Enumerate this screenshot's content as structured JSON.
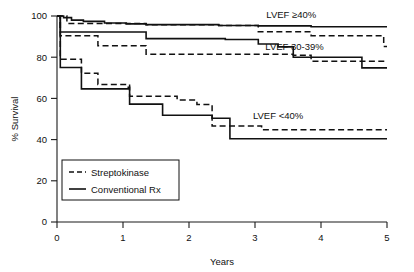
{
  "chart_data": {
    "type": "line",
    "title": "",
    "xlabel": "Years",
    "ylabel": "% Survival",
    "xlim": [
      0,
      5
    ],
    "ylim": [
      0,
      100
    ],
    "xticks": [
      "0",
      "1",
      "2",
      "3",
      "4",
      "5"
    ],
    "yticks": [
      "0",
      "20",
      "40",
      "60",
      "80",
      "100"
    ],
    "grid": false,
    "legend_position": "lower-left",
    "legend": [
      {
        "name": "Streptokinase",
        "style": "dashed"
      },
      {
        "name": "Conventional Rx",
        "style": "solid"
      }
    ],
    "group_labels": [
      {
        "id": "high",
        "text": "LVEF ≥40%"
      },
      {
        "id": "mid",
        "text": "LVEF 30-39%"
      },
      {
        "id": "low",
        "text": "LVEF <40%"
      }
    ],
    "series": [
      {
        "name": "LVEF ≥40% - Conventional Rx",
        "group": "LVEF ≥40%",
        "treatment": "Conventional Rx",
        "style": "solid",
        "points": [
          [
            0.0,
            100.0
          ],
          [
            0.1,
            100.0
          ],
          [
            0.1,
            99.2
          ],
          [
            0.22,
            99.2
          ],
          [
            0.22,
            98.0
          ],
          [
            0.4,
            98.0
          ],
          [
            0.4,
            97.4
          ],
          [
            0.72,
            97.4
          ],
          [
            0.72,
            96.6
          ],
          [
            1.05,
            96.6
          ],
          [
            1.05,
            96.2
          ],
          [
            1.35,
            96.2
          ],
          [
            1.35,
            95.8
          ],
          [
            2.45,
            95.8
          ],
          [
            2.45,
            95.4
          ],
          [
            3.05,
            95.4
          ],
          [
            3.05,
            95.2
          ],
          [
            3.85,
            95.2
          ],
          [
            3.85,
            94.8
          ],
          [
            5.0,
            94.8
          ]
        ]
      },
      {
        "name": "LVEF ≥40% - Streptokinase",
        "group": "LVEF ≥40%",
        "treatment": "Streptokinase",
        "style": "dashed",
        "points": [
          [
            0.0,
            100.0
          ],
          [
            0.15,
            100.0
          ],
          [
            0.15,
            96.4
          ],
          [
            1.35,
            96.4
          ],
          [
            1.35,
            95.8
          ],
          [
            2.45,
            95.8
          ],
          [
            2.45,
            95.4
          ],
          [
            3.05,
            95.4
          ],
          [
            3.05,
            92.4
          ],
          [
            3.85,
            92.4
          ],
          [
            3.85,
            90.4
          ],
          [
            4.95,
            90.4
          ],
          [
            4.95,
            85.2
          ],
          [
            5.0,
            85.2
          ]
        ]
      },
      {
        "name": "LVEF 30-39% - Conventional Rx",
        "group": "LVEF 30-39%",
        "treatment": "Conventional Rx",
        "style": "solid",
        "points": [
          [
            0.0,
            100.0
          ],
          [
            0.05,
            100.0
          ],
          [
            0.05,
            92.2
          ],
          [
            1.35,
            92.2
          ],
          [
            1.35,
            89.0
          ],
          [
            2.55,
            89.0
          ],
          [
            2.55,
            88.6
          ],
          [
            3.05,
            88.6
          ],
          [
            3.05,
            86.4
          ],
          [
            3.35,
            86.4
          ],
          [
            3.35,
            85.0
          ],
          [
            3.58,
            85.0
          ],
          [
            3.58,
            80.0
          ],
          [
            4.62,
            80.0
          ],
          [
            4.62,
            74.8
          ],
          [
            5.0,
            74.8
          ]
        ]
      },
      {
        "name": "LVEF 30-39% - Streptokinase",
        "group": "LVEF 30-39%",
        "treatment": "Streptokinase",
        "style": "dashed",
        "points": [
          [
            0.0,
            100.0
          ],
          [
            0.05,
            100.0
          ],
          [
            0.05,
            90.4
          ],
          [
            0.62,
            90.4
          ],
          [
            0.62,
            85.6
          ],
          [
            1.35,
            85.6
          ],
          [
            1.35,
            81.4
          ],
          [
            3.58,
            81.4
          ],
          [
            3.58,
            81.0
          ],
          [
            3.85,
            81.0
          ],
          [
            3.85,
            78.0
          ],
          [
            5.0,
            78.0
          ]
        ]
      },
      {
        "name": "LVEF <40% - Conventional Rx",
        "group": "LVEF <40%",
        "treatment": "Conventional Rx",
        "style": "solid",
        "points": [
          [
            0.0,
            100.0
          ],
          [
            0.05,
            100.0
          ],
          [
            0.05,
            75.0
          ],
          [
            0.37,
            75.0
          ],
          [
            0.37,
            64.6
          ],
          [
            1.08,
            64.6
          ],
          [
            1.08,
            65.4
          ],
          [
            1.1,
            65.4
          ],
          [
            1.1,
            57.2
          ],
          [
            1.6,
            57.2
          ],
          [
            1.6,
            51.8
          ],
          [
            2.35,
            51.8
          ],
          [
            2.35,
            50.4
          ],
          [
            2.62,
            50.4
          ],
          [
            2.62,
            40.4
          ],
          [
            5.0,
            40.4
          ]
        ]
      },
      {
        "name": "LVEF <40% - Streptokinase",
        "group": "LVEF <40%",
        "treatment": "Streptokinase",
        "style": "dashed",
        "points": [
          [
            0.0,
            100.0
          ],
          [
            0.05,
            100.0
          ],
          [
            0.05,
            79.0
          ],
          [
            0.37,
            79.0
          ],
          [
            0.37,
            72.2
          ],
          [
            0.62,
            72.2
          ],
          [
            0.62,
            66.8
          ],
          [
            1.1,
            66.8
          ],
          [
            1.1,
            61.0
          ],
          [
            1.82,
            61.0
          ],
          [
            1.82,
            59.2
          ],
          [
            2.12,
            59.2
          ],
          [
            2.12,
            57.0
          ],
          [
            2.35,
            57.0
          ],
          [
            2.35,
            46.6
          ],
          [
            3.1,
            46.6
          ],
          [
            3.1,
            44.8
          ],
          [
            5.0,
            44.8
          ]
        ]
      }
    ],
    "annotations": [
      {
        "text": "LVEF ≥40%",
        "x": 3.55,
        "y": 99.0
      },
      {
        "text": "LVEF 30-39%",
        "x": 3.6,
        "y": 83.5
      },
      {
        "text": "LVEF <40%",
        "x": 3.35,
        "y": 50.0
      }
    ]
  }
}
